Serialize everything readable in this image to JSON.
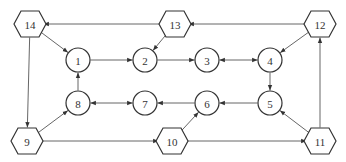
{
  "diagram": {
    "type": "directed-graph",
    "nodes": [
      {
        "id": "1",
        "label": "1",
        "shape": "circle",
        "x": 78,
        "y": 60
      },
      {
        "id": "2",
        "label": "2",
        "shape": "circle",
        "x": 145,
        "y": 60
      },
      {
        "id": "3",
        "label": "3",
        "shape": "circle",
        "x": 207,
        "y": 60
      },
      {
        "id": "4",
        "label": "4",
        "shape": "circle",
        "x": 270,
        "y": 60
      },
      {
        "id": "5",
        "label": "5",
        "shape": "circle",
        "x": 270,
        "y": 103
      },
      {
        "id": "6",
        "label": "6",
        "shape": "circle",
        "x": 207,
        "y": 103
      },
      {
        "id": "7",
        "label": "7",
        "shape": "circle",
        "x": 145,
        "y": 103
      },
      {
        "id": "8",
        "label": "8",
        "shape": "circle",
        "x": 78,
        "y": 103
      },
      {
        "id": "9",
        "label": "9",
        "shape": "hexagon",
        "x": 27,
        "y": 141
      },
      {
        "id": "10",
        "label": "10",
        "shape": "hexagon",
        "x": 172,
        "y": 141
      },
      {
        "id": "11",
        "label": "11",
        "shape": "hexagon",
        "x": 320,
        "y": 141
      },
      {
        "id": "12",
        "label": "12",
        "shape": "hexagon",
        "x": 320,
        "y": 24
      },
      {
        "id": "13",
        "label": "13",
        "shape": "hexagon",
        "x": 175,
        "y": 24
      },
      {
        "id": "14",
        "label": "14",
        "shape": "hexagon",
        "x": 30,
        "y": 24
      }
    ],
    "edges": [
      {
        "from": "12",
        "to": "13",
        "bidirectional": false
      },
      {
        "from": "13",
        "to": "14",
        "bidirectional": false
      },
      {
        "from": "14",
        "to": "1",
        "bidirectional": false
      },
      {
        "from": "14",
        "to": "9",
        "bidirectional": false
      },
      {
        "from": "13",
        "to": "2",
        "bidirectional": false
      },
      {
        "from": "1",
        "to": "2",
        "bidirectional": false
      },
      {
        "from": "2",
        "to": "3",
        "bidirectional": false
      },
      {
        "from": "3",
        "to": "4",
        "bidirectional": true
      },
      {
        "from": "12",
        "to": "4",
        "bidirectional": false
      },
      {
        "from": "4",
        "to": "5",
        "bidirectional": false
      },
      {
        "from": "11",
        "to": "12",
        "bidirectional": false
      },
      {
        "from": "11",
        "to": "5",
        "bidirectional": false
      },
      {
        "from": "5",
        "to": "6",
        "bidirectional": false
      },
      {
        "from": "6",
        "to": "7",
        "bidirectional": false
      },
      {
        "from": "7",
        "to": "8",
        "bidirectional": true
      },
      {
        "from": "8",
        "to": "1",
        "bidirectional": false
      },
      {
        "from": "9",
        "to": "8",
        "bidirectional": false
      },
      {
        "from": "9",
        "to": "10",
        "bidirectional": false
      },
      {
        "from": "10",
        "to": "6",
        "bidirectional": false
      },
      {
        "from": "10",
        "to": "11",
        "bidirectional": false
      }
    ],
    "colors": {
      "stroke": "#333333",
      "edge": "#555555",
      "background": "#ffffff"
    }
  }
}
